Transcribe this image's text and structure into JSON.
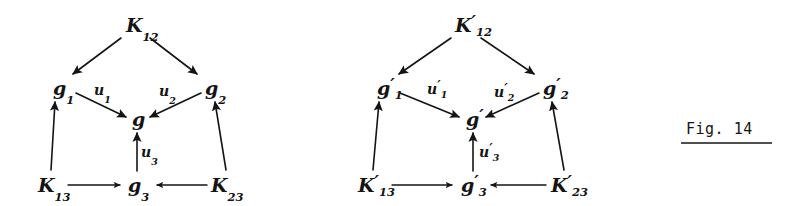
{
  "figure": {
    "caption": "Fig. 14",
    "background_color": "#ffffff",
    "ink_color": "#141414",
    "width": 792,
    "height": 206
  },
  "diagrams": [
    {
      "id": "left-diagram",
      "name": "unprimed-commutative-diagram",
      "nodes": [
        {
          "id": "K12",
          "base": "K",
          "sub": "12",
          "prime": "",
          "x": 126,
          "y": 32
        },
        {
          "id": "g1",
          "base": "g",
          "sub": "1",
          "prime": "",
          "x": 53,
          "y": 95
        },
        {
          "id": "g2",
          "base": "g",
          "sub": "2",
          "prime": "",
          "x": 205,
          "y": 95
        },
        {
          "id": "g",
          "base": "g",
          "sub": "",
          "prime": "",
          "x": 132,
          "y": 126
        },
        {
          "id": "K13",
          "base": "K",
          "sub": "13",
          "prime": "",
          "x": 38,
          "y": 192
        },
        {
          "id": "g3",
          "base": "g",
          "sub": "3",
          "prime": "",
          "x": 128,
          "y": 192
        },
        {
          "id": "K23",
          "base": "K",
          "sub": "23",
          "prime": "",
          "x": 211,
          "y": 192
        }
      ],
      "edge_labels": [
        {
          "id": "u1",
          "base": "u",
          "sub": "1",
          "prime": "",
          "x": 94,
          "y": 95
        },
        {
          "id": "u2",
          "base": "u",
          "sub": "2",
          "prime": "",
          "x": 159,
          "y": 96
        },
        {
          "id": "u3",
          "base": "u",
          "sub": "3",
          "prime": "",
          "x": 141,
          "y": 157
        }
      ],
      "edges": [
        {
          "id": "K12-to-g1",
          "from": "K12",
          "to": "g1",
          "x1": 121,
          "y1": 38,
          "x2": 73,
          "y2": 74
        },
        {
          "id": "K12-to-g2",
          "from": "K12",
          "to": "g2",
          "x1": 150,
          "y1": 38,
          "x2": 197,
          "y2": 74
        },
        {
          "id": "g1-to-g",
          "from": "g1",
          "to": "g",
          "x1": 76,
          "y1": 93,
          "x2": 126,
          "y2": 117
        },
        {
          "id": "g2-to-g",
          "from": "g2",
          "to": "g",
          "x1": 201,
          "y1": 93,
          "x2": 150,
          "y2": 117
        },
        {
          "id": "g3-to-g",
          "from": "g3",
          "to": "g",
          "x1": 137,
          "y1": 171,
          "x2": 137,
          "y2": 133
        },
        {
          "id": "K13-to-g1",
          "from": "K13",
          "to": "g1",
          "x1": 51,
          "y1": 170,
          "x2": 55,
          "y2": 102
        },
        {
          "id": "K23-to-g2",
          "from": "K23",
          "to": "g2",
          "x1": 226,
          "y1": 170,
          "x2": 215,
          "y2": 102
        },
        {
          "id": "K13-to-g3",
          "from": "K13",
          "to": "g3",
          "x1": 68,
          "y1": 185,
          "x2": 120,
          "y2": 185
        },
        {
          "id": "K23-to-g3",
          "from": "K23",
          "to": "g3",
          "x1": 207,
          "y1": 185,
          "x2": 157,
          "y2": 185
        }
      ]
    },
    {
      "id": "right-diagram",
      "name": "primed-commutative-diagram",
      "nodes": [
        {
          "id": "K12p",
          "base": "K",
          "sub": "12",
          "prime": "′",
          "x": 455,
          "y": 32
        },
        {
          "id": "g1p",
          "base": "g",
          "sub": "1",
          "prime": "′",
          "x": 377,
          "y": 95
        },
        {
          "id": "g2p",
          "base": "g",
          "sub": "2",
          "prime": "′",
          "x": 543,
          "y": 95
        },
        {
          "id": "gp",
          "base": "g",
          "sub": "",
          "prime": "′",
          "x": 466,
          "y": 126
        },
        {
          "id": "K13p",
          "base": "K",
          "sub": "13",
          "prime": "′",
          "x": 358,
          "y": 192
        },
        {
          "id": "g3p",
          "base": "g",
          "sub": "3",
          "prime": "′",
          "x": 461,
          "y": 192
        },
        {
          "id": "K23p",
          "base": "K",
          "sub": "23",
          "prime": "′",
          "x": 551,
          "y": 192
        }
      ],
      "edge_labels": [
        {
          "id": "u1p",
          "base": "u",
          "sub": "1",
          "prime": "′",
          "x": 427,
          "y": 94
        },
        {
          "id": "u2p",
          "base": "u",
          "sub": "2",
          "prime": "′",
          "x": 494,
          "y": 97
        },
        {
          "id": "u3p",
          "base": "u",
          "sub": "3",
          "prime": "′",
          "x": 479,
          "y": 157
        }
      ],
      "edges": [
        {
          "id": "K12p-to-g1p",
          "from": "K12p",
          "to": "g1p",
          "x1": 451,
          "y1": 38,
          "x2": 399,
          "y2": 74
        },
        {
          "id": "K12p-to-g2p",
          "from": "K12p",
          "to": "g2p",
          "x1": 481,
          "y1": 38,
          "x2": 534,
          "y2": 74
        },
        {
          "id": "g1p-to-gp",
          "from": "g1p",
          "to": "gp",
          "x1": 400,
          "y1": 93,
          "x2": 459,
          "y2": 117
        },
        {
          "id": "g2pp-to-gp",
          "from": "g2p",
          "to": "gp",
          "x1": 539,
          "y1": 93,
          "x2": 486,
          "y2": 117
        },
        {
          "id": "g3p-to-gp",
          "from": "g3p",
          "to": "gp",
          "x1": 473,
          "y1": 171,
          "x2": 473,
          "y2": 133
        },
        {
          "id": "K13p-to-g1p",
          "from": "K13p",
          "to": "g1p",
          "x1": 373,
          "y1": 170,
          "x2": 379,
          "y2": 102
        },
        {
          "id": "K23p-to-g2p",
          "from": "K23p",
          "to": "g2p",
          "x1": 564,
          "y1": 170,
          "x2": 552,
          "y2": 102
        },
        {
          "id": "K13p-to-g3p",
          "from": "K13p",
          "to": "g3p",
          "x1": 392,
          "y1": 185,
          "x2": 452,
          "y2": 185
        },
        {
          "id": "K23p-to-g3p",
          "from": "K23p",
          "to": "g3p",
          "x1": 546,
          "y1": 185,
          "x2": 491,
          "y2": 185
        }
      ]
    }
  ],
  "caption_block": {
    "text": "Fig. 14",
    "x": 686,
    "y": 134,
    "rule": {
      "x1": 681,
      "x2": 772,
      "y": 143
    }
  }
}
